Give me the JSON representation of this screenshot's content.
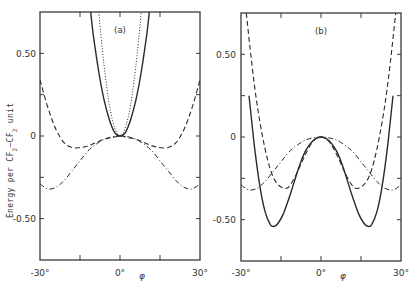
{
  "chart_data": [
    {
      "type": "line",
      "panel_label": "(a)",
      "title": "",
      "xlabel": "φ",
      "ylabel": "Energy per CF2–CF2 unit",
      "xlim": [
        -30,
        30
      ],
      "ylim": [
        -0.75,
        0.75
      ],
      "x_tick_labels": [
        "-30°",
        "0°",
        "30°"
      ],
      "y_tick_labels": [
        "0.50",
        "0",
        "-0.50"
      ],
      "grid": false,
      "series": [
        {
          "name": "solid",
          "style": "solid",
          "x": [
            -11,
            -10,
            -8,
            -6,
            -4,
            -2,
            0,
            2,
            4,
            6,
            8,
            10,
            11
          ],
          "y": [
            0.75,
            0.61,
            0.39,
            0.22,
            0.1,
            0.02,
            0,
            0.02,
            0.1,
            0.22,
            0.39,
            0.61,
            0.75
          ]
        },
        {
          "name": "dotted",
          "style": "dotted",
          "x": [
            -8,
            -6,
            -4,
            -2,
            0,
            2,
            4,
            6,
            8
          ],
          "y": [
            0.75,
            0.43,
            0.19,
            0.05,
            0,
            0.05,
            0.19,
            0.43,
            0.75
          ]
        },
        {
          "name": "dashed",
          "style": "dashed",
          "x": [
            -30,
            -27,
            -24,
            -21,
            -18,
            -15,
            -12,
            -9,
            -6,
            -3,
            0,
            3,
            6,
            9,
            12,
            15,
            18,
            21,
            24,
            27,
            30
          ],
          "y": [
            0.34,
            0.17,
            0.04,
            -0.04,
            -0.07,
            -0.07,
            -0.06,
            -0.04,
            -0.02,
            -0.01,
            0,
            -0.01,
            -0.02,
            -0.04,
            -0.06,
            -0.07,
            -0.07,
            -0.04,
            0.04,
            0.17,
            0.34
          ]
        },
        {
          "name": "dash-dot",
          "style": "dashdot",
          "x": [
            -30,
            -27,
            -24,
            -21,
            -18,
            -15,
            -12,
            -9,
            -6,
            -3,
            0,
            3,
            6,
            9,
            12,
            15,
            18,
            21,
            24,
            27,
            30
          ],
          "y": [
            -0.29,
            -0.32,
            -0.31,
            -0.27,
            -0.21,
            -0.15,
            -0.09,
            -0.05,
            -0.02,
            -0.005,
            0,
            -0.005,
            -0.02,
            -0.05,
            -0.09,
            -0.15,
            -0.21,
            -0.27,
            -0.31,
            -0.32,
            -0.29
          ]
        }
      ]
    },
    {
      "type": "line",
      "panel_label": "(b)",
      "title": "",
      "xlabel": "φ",
      "ylabel": "",
      "xlim": [
        -30,
        30
      ],
      "ylim": [
        -0.75,
        0.75
      ],
      "x_tick_labels": [
        "-30°",
        "0°",
        "30°"
      ],
      "y_tick_labels": [
        "0.50",
        "0",
        "-0.50"
      ],
      "grid": false,
      "series": [
        {
          "name": "solid",
          "style": "solid",
          "x": [
            -27,
            -25,
            -23,
            -21,
            -19,
            -17.5,
            -16,
            -14,
            -12,
            -10,
            -8,
            -6,
            -4,
            -2,
            0,
            2,
            4,
            6,
            8,
            10,
            12,
            14,
            16,
            17.5,
            19,
            21,
            23,
            25,
            27
          ],
          "y": [
            0.25,
            -0.05,
            -0.29,
            -0.45,
            -0.53,
            -0.54,
            -0.52,
            -0.46,
            -0.37,
            -0.27,
            -0.17,
            -0.09,
            -0.04,
            -0.01,
            0,
            -0.01,
            -0.04,
            -0.09,
            -0.17,
            -0.27,
            -0.37,
            -0.46,
            -0.52,
            -0.54,
            -0.53,
            -0.45,
            -0.29,
            -0.05,
            0.25
          ]
        },
        {
          "name": "dashed",
          "style": "dashed",
          "x": [
            -28,
            -26,
            -24,
            -22,
            -20,
            -18,
            -16,
            -14,
            -13,
            -12,
            -10,
            -8,
            -6,
            -4,
            -2,
            0,
            2,
            4,
            6,
            8,
            10,
            12,
            13,
            14,
            16,
            18,
            20,
            22,
            24,
            26,
            28
          ],
          "y": [
            0.75,
            0.45,
            0.2,
            0.01,
            -0.14,
            -0.24,
            -0.29,
            -0.31,
            -0.31,
            -0.3,
            -0.25,
            -0.18,
            -0.11,
            -0.05,
            -0.01,
            0,
            -0.01,
            -0.05,
            -0.11,
            -0.18,
            -0.25,
            -0.3,
            -0.31,
            -0.31,
            -0.29,
            -0.24,
            -0.14,
            0.01,
            0.2,
            0.45,
            0.75
          ]
        },
        {
          "name": "dash-dot",
          "style": "dashdot",
          "x": [
            -30,
            -27,
            -24,
            -21,
            -18,
            -15,
            -12,
            -9,
            -6,
            -3,
            0,
            3,
            6,
            9,
            12,
            15,
            18,
            21,
            24,
            27,
            30
          ],
          "y": [
            -0.29,
            -0.32,
            -0.31,
            -0.27,
            -0.21,
            -0.15,
            -0.09,
            -0.05,
            -0.02,
            -0.005,
            0,
            -0.005,
            -0.02,
            -0.05,
            -0.09,
            -0.15,
            -0.21,
            -0.27,
            -0.31,
            -0.32,
            -0.29
          ]
        }
      ]
    }
  ]
}
